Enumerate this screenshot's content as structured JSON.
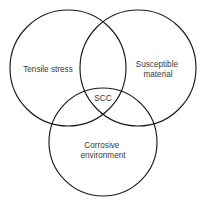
{
  "diagram": {
    "type": "venn-3-set",
    "background_color": "#ffffff",
    "stroke_color": "#1a1a1a",
    "text_color": "#3a3a3a",
    "sets": [
      {
        "id": "tensile-stress",
        "label": "Tensile stress",
        "lines": [
          "Tensile stress"
        ],
        "position": "left",
        "cx": 68,
        "cy": 68,
        "r": 58,
        "label_x": 48,
        "label_y": 70
      },
      {
        "id": "susceptible-material",
        "label": "Susceptible material",
        "lines": [
          "Susceptible",
          "material"
        ],
        "position": "right",
        "cx": 138,
        "cy": 68,
        "r": 58,
        "label_x": 158,
        "label_y": 65
      },
      {
        "id": "corrosive-environment",
        "label": "Corrosive environment",
        "lines": [
          "Corrosive",
          "environment"
        ],
        "position": "bottom",
        "cx": 103,
        "cy": 142,
        "r": 54,
        "label_x": 103,
        "label_y": 146
      }
    ],
    "intersection": {
      "id": "scc",
      "label": "SCC",
      "label_x": 103,
      "label_y": 99
    }
  }
}
